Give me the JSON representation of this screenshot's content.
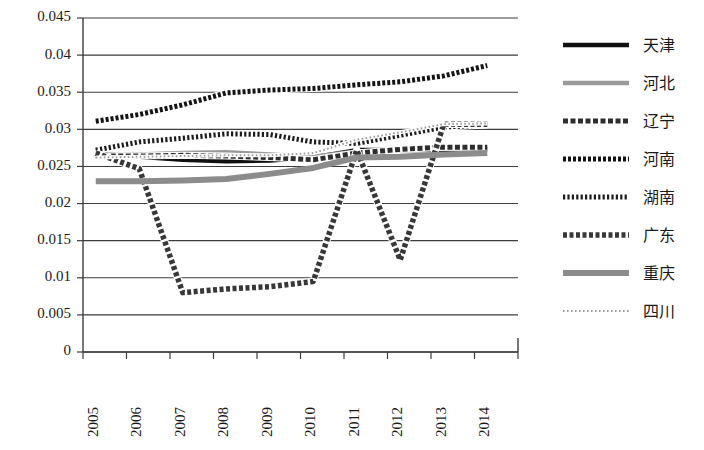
{
  "chart_data": {
    "type": "line",
    "title": "",
    "subtitle": "",
    "xlabel": "",
    "ylabel": "",
    "grid": true,
    "legend_position": "right",
    "x": [
      2005,
      2006,
      2007,
      2008,
      2009,
      2010,
      2011,
      2012,
      2013,
      2014
    ],
    "categories": [
      "2005",
      "2006",
      "2007",
      "2008",
      "2009",
      "2010",
      "2011",
      "2012",
      "2013",
      "2014"
    ],
    "ylim": [
      0,
      0.045
    ],
    "yticks": [
      0,
      0.005,
      0.01,
      0.015,
      0.02,
      0.025,
      0.03,
      0.035,
      0.04,
      0.045
    ],
    "ytick_labels": [
      "0",
      "0.005",
      "0.01",
      "0.015",
      "0.02",
      "0.025",
      "0.03",
      "0.035",
      "0.04",
      "0.045"
    ],
    "series": [
      {
        "name": "天津",
        "style": "solid-black",
        "color": "#101010",
        "width": 4.5,
        "dash": "",
        "values": [
          0.0267,
          0.0263,
          0.0259,
          0.0257,
          0.0258,
          0.0262,
          0.0272,
          0.0272,
          0.0272,
          0.0273
        ]
      },
      {
        "name": "河北",
        "style": "solid-gray",
        "color": "#9a9a9a",
        "width": 4.5,
        "dash": "",
        "values": [
          0.0265,
          0.0266,
          0.0268,
          0.0269,
          0.0266,
          0.0263,
          0.027,
          0.0272,
          0.0274,
          0.0275
        ]
      },
      {
        "name": "辽宁",
        "style": "diagonal-hatch",
        "color": "#2e2e2e",
        "width": 5,
        "dash": "5,2.5",
        "values": [
          0.0264,
          0.0264,
          0.0265,
          0.0264,
          0.0262,
          0.0259,
          0.0268,
          0.0273,
          0.0276,
          0.0276
        ]
      },
      {
        "name": "河南",
        "style": "zigzag-x",
        "color": "#141414",
        "width": 5,
        "dash": "3,2",
        "values": [
          0.0311,
          0.032,
          0.0333,
          0.0349,
          0.0353,
          0.0355,
          0.036,
          0.0364,
          0.0372,
          0.0386
        ]
      },
      {
        "name": "湖南",
        "style": "vertical-ticks",
        "color": "#1c1c1c",
        "width": 5,
        "dash": "2.2,2.2",
        "values": [
          0.0272,
          0.0283,
          0.0288,
          0.0294,
          0.0293,
          0.0283,
          0.0281,
          0.0292,
          0.0303,
          0.0306
        ]
      },
      {
        "name": "广东",
        "style": "square-dots",
        "color": "#383838",
        "width": 5.5,
        "dash": "4,2.5",
        "values": [
          0.0268,
          0.0247,
          0.008,
          0.0085,
          0.0088,
          0.0095,
          0.0272,
          0.0124,
          0.0307,
          0.0307
        ]
      },
      {
        "name": "重庆",
        "style": "solid-thick-gray",
        "color": "#8c8c8c",
        "width": 6,
        "dash": "",
        "values": [
          0.023,
          0.023,
          0.0231,
          0.0233,
          0.024,
          0.0248,
          0.0262,
          0.0263,
          0.0266,
          0.0268
        ]
      },
      {
        "name": "四川",
        "style": "fine-dotted",
        "color": "#9d9d9d",
        "width": 2,
        "dash": "1.6,2.4",
        "values": [
          0.0262,
          0.0263,
          0.0264,
          0.0265,
          0.0265,
          0.0268,
          0.0286,
          0.0296,
          0.0307,
          0.0308
        ]
      }
    ]
  },
  "legend": {
    "items": [
      {
        "label": "天津"
      },
      {
        "label": "河北"
      },
      {
        "label": "辽宁"
      },
      {
        "label": "河南"
      },
      {
        "label": "湖南"
      },
      {
        "label": "广东"
      },
      {
        "label": "重庆"
      },
      {
        "label": "四川"
      }
    ]
  }
}
